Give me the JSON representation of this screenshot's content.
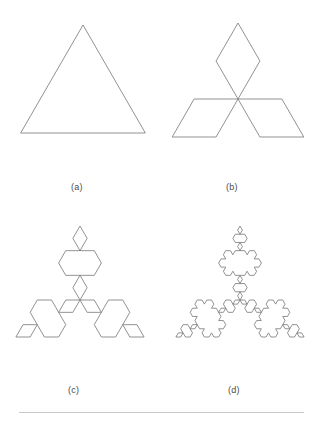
{
  "figure": {
    "background_color": "#ffffff",
    "stroke_color": "#76767a",
    "stroke_width": 0.8,
    "label_color": "#4a4a4a",
    "panels": [
      {
        "id": "panel-a",
        "label": "(a)",
        "iteration": 0,
        "shape": "equilateral-triangle",
        "center_x": 83,
        "center_y": 97,
        "radius": 72,
        "label_x": 83,
        "label_y": 182
      },
      {
        "id": "panel-b",
        "label": "(b)",
        "iteration": 1,
        "shape": "koch-snowflake",
        "center_x": 238,
        "center_y": 99,
        "radius": 76,
        "label_x": 238,
        "label_y": 182
      },
      {
        "id": "panel-c",
        "label": "(c)",
        "iteration": 2,
        "shape": "koch-snowflake",
        "center_x": 80,
        "center_y": 300,
        "radius": 74,
        "label_x": 80,
        "label_y": 385
      },
      {
        "id": "panel-d",
        "label": "(d)",
        "iteration": 3,
        "shape": "koch-snowflake",
        "center_x": 240,
        "center_y": 300,
        "radius": 74,
        "label_x": 240,
        "label_y": 385
      }
    ],
    "footer_rule": {
      "x": 19,
      "y": 412,
      "width": 285,
      "color": "#c9c9c9"
    }
  }
}
